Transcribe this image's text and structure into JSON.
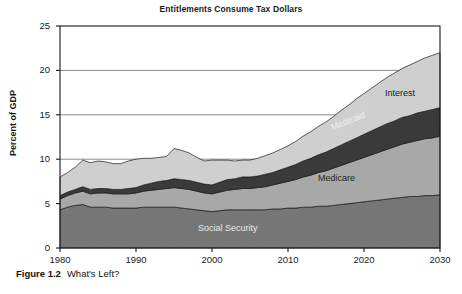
{
  "caption": {
    "figure_number": "Figure 1.2",
    "figure_title": "What's Left?"
  },
  "axis": {
    "y_title": "Percent of GDP",
    "y_ticks": [
      "0",
      "5",
      "10",
      "15",
      "20",
      "25"
    ],
    "x_ticks": [
      "1980",
      "1990",
      "2000",
      "2010",
      "2020",
      "2030"
    ]
  },
  "labels": {
    "interest": "Interest",
    "medicaid": "Medicaid",
    "medicare": "Medicare",
    "social_security": "Social Security"
  },
  "colors": {
    "interest": "#cfcfcf",
    "medicaid": "#3a3a3a",
    "medicare": "#a8a8a8",
    "social_security": "#767676",
    "outline": "#1a1a1a",
    "gridline": "#6e6e6e",
    "plot_background": "#ffffff"
  },
  "chart_data": {
    "type": "area",
    "title": "Entitlements Consume Tax Dollars",
    "xlabel": "",
    "ylabel": "Percent of GDP",
    "xlim": [
      1980,
      2030
    ],
    "ylim": [
      0,
      25
    ],
    "ytick_values": [
      0,
      5,
      10,
      15,
      20,
      25
    ],
    "xtick_values": [
      1980,
      1990,
      2000,
      2010,
      2020,
      2030
    ],
    "grid": true,
    "grid_axis": "y",
    "legend": "inline-annotations",
    "stacked": true,
    "x": [
      1980,
      1981,
      1982,
      1983,
      1984,
      1985,
      1986,
      1987,
      1988,
      1989,
      1990,
      1991,
      1992,
      1993,
      1994,
      1995,
      1996,
      1997,
      1998,
      1999,
      2000,
      2001,
      2002,
      2003,
      2004,
      2005,
      2006,
      2007,
      2008,
      2009,
      2010,
      2011,
      2012,
      2013,
      2014,
      2015,
      2016,
      2017,
      2018,
      2019,
      2020,
      2021,
      2022,
      2023,
      2024,
      2025,
      2026,
      2027,
      2028,
      2029,
      2030
    ],
    "series": [
      {
        "name": "Social Security",
        "values": [
          4.3,
          4.6,
          4.8,
          4.9,
          4.6,
          4.6,
          4.6,
          4.5,
          4.5,
          4.5,
          4.5,
          4.6,
          4.6,
          4.6,
          4.6,
          4.6,
          4.5,
          4.4,
          4.3,
          4.2,
          4.1,
          4.2,
          4.3,
          4.3,
          4.3,
          4.3,
          4.3,
          4.3,
          4.4,
          4.4,
          4.5,
          4.5,
          4.6,
          4.6,
          4.7,
          4.7,
          4.8,
          4.9,
          5.0,
          5.1,
          5.2,
          5.3,
          5.4,
          5.5,
          5.6,
          5.7,
          5.8,
          5.8,
          5.9,
          5.9,
          6.0
        ]
      },
      {
        "name": "Medicare",
        "values": [
          1.2,
          1.3,
          1.4,
          1.5,
          1.5,
          1.6,
          1.6,
          1.6,
          1.6,
          1.6,
          1.7,
          1.8,
          1.9,
          2.0,
          2.1,
          2.2,
          2.2,
          2.2,
          2.1,
          2.0,
          2.0,
          2.1,
          2.2,
          2.3,
          2.4,
          2.4,
          2.5,
          2.6,
          2.7,
          2.9,
          3.0,
          3.2,
          3.4,
          3.6,
          3.8,
          4.0,
          4.2,
          4.4,
          4.6,
          4.8,
          5.0,
          5.2,
          5.4,
          5.6,
          5.8,
          6.0,
          6.1,
          6.3,
          6.4,
          6.5,
          6.6
        ]
      },
      {
        "name": "Medicaid",
        "values": [
          0.4,
          0.4,
          0.4,
          0.5,
          0.5,
          0.5,
          0.5,
          0.5,
          0.5,
          0.6,
          0.6,
          0.7,
          0.8,
          0.9,
          0.9,
          1.0,
          1.0,
          1.0,
          1.0,
          1.0,
          1.0,
          1.1,
          1.2,
          1.2,
          1.3,
          1.3,
          1.3,
          1.4,
          1.4,
          1.5,
          1.6,
          1.7,
          1.8,
          1.9,
          2.0,
          2.1,
          2.2,
          2.3,
          2.4,
          2.5,
          2.6,
          2.7,
          2.8,
          2.9,
          2.9,
          3.0,
          3.0,
          3.1,
          3.1,
          3.2,
          3.2
        ]
      },
      {
        "name": "Interest",
        "values": [
          2.1,
          2.2,
          2.5,
          3.0,
          3.0,
          3.1,
          3.0,
          2.9,
          2.9,
          3.1,
          3.2,
          3.0,
          2.8,
          2.7,
          2.7,
          3.4,
          3.3,
          3.1,
          2.8,
          2.6,
          2.8,
          2.5,
          2.2,
          2.0,
          1.9,
          1.9,
          2.0,
          2.1,
          2.2,
          2.3,
          2.4,
          2.6,
          2.8,
          3.0,
          3.2,
          3.4,
          3.6,
          3.9,
          4.1,
          4.4,
          4.6,
          4.8,
          5.0,
          5.2,
          5.4,
          5.5,
          5.7,
          5.8,
          6.0,
          6.1,
          6.2
        ]
      }
    ]
  }
}
